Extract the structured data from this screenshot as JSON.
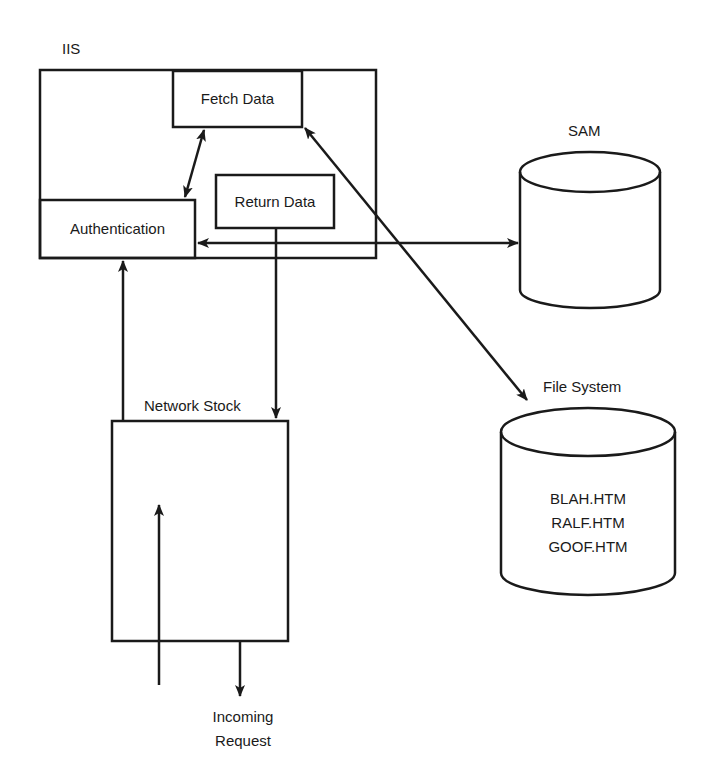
{
  "diagram": {
    "iis": {
      "label": "IIS"
    },
    "fetch_data": {
      "label": "Fetch Data"
    },
    "return_data": {
      "label": "Return Data"
    },
    "authentication": {
      "label": "Authentication"
    },
    "sam": {
      "label": "SAM"
    },
    "file_system": {
      "label": "File System",
      "files": [
        "BLAH.HTM",
        "RALF.HTM",
        "GOOF.HTM"
      ]
    },
    "network_stack": {
      "label": "Network Stock"
    },
    "incoming_request": {
      "line1": "Incoming",
      "line2": "Request"
    },
    "colors": {
      "stroke": "#1a1a1a",
      "background": "#ffffff"
    }
  }
}
